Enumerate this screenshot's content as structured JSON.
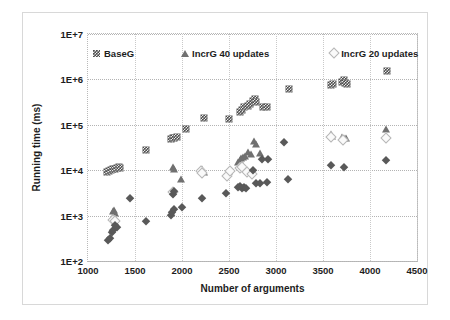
{
  "chart_data": {
    "type": "scatter",
    "title": "",
    "xlabel": "Number of arguments",
    "ylabel": "Running time (ms)",
    "xlim": [
      1000,
      4500
    ],
    "ylim": [
      100,
      10000000
    ],
    "yscale": "log",
    "xticks": [
      "1000",
      "1500",
      "2000",
      "2500",
      "3000",
      "3500",
      "4000",
      "4500"
    ],
    "xtick_values": [
      1000,
      1500,
      2000,
      2500,
      3000,
      3500,
      4000,
      4500
    ],
    "yticks": [
      "1E+2",
      "1E+3",
      "1E+4",
      "1E+5",
      "1E+6",
      "1E+7"
    ],
    "ytick_values": [
      100,
      1000,
      10000,
      100000,
      1000000,
      10000000
    ],
    "grid": true,
    "legend_position": "top-inside",
    "series": [
      {
        "name": "BaseG",
        "marker": "crosshatch-square",
        "color": "#4d4d4d",
        "points": [
          [
            1205,
            9200
          ],
          [
            1225,
            9600
          ],
          [
            1245,
            10000
          ],
          [
            1265,
            10400
          ],
          [
            1285,
            10800
          ],
          [
            1305,
            11200
          ],
          [
            1325,
            11600
          ],
          [
            1345,
            11200
          ],
          [
            1620,
            28000
          ],
          [
            1880,
            48000
          ],
          [
            1900,
            52000
          ],
          [
            1920,
            50000
          ],
          [
            1945,
            55000
          ],
          [
            2040,
            82000
          ],
          [
            2230,
            140000
          ],
          [
            2500,
            135000
          ],
          [
            2620,
            190000
          ],
          [
            2640,
            210000
          ],
          [
            2660,
            250000
          ],
          [
            2700,
            265000
          ],
          [
            2720,
            290000
          ],
          [
            2760,
            330000
          ],
          [
            2775,
            370000
          ],
          [
            2790,
            310000
          ],
          [
            2860,
            250000
          ],
          [
            2900,
            245000
          ],
          [
            3140,
            620000
          ],
          [
            3580,
            760000
          ],
          [
            3610,
            790000
          ],
          [
            3700,
            880000
          ],
          [
            3720,
            950000
          ],
          [
            3735,
            830000
          ],
          [
            3750,
            780000
          ],
          [
            4180,
            1500000
          ]
        ]
      },
      {
        "name": "IncrG 40 updates",
        "marker": "triangle",
        "color": "#707070",
        "points": [
          [
            1265,
            1250
          ],
          [
            1280,
            1350
          ],
          [
            1290,
            1150
          ],
          [
            1900,
            11500
          ],
          [
            1915,
            10500
          ],
          [
            1990,
            6500
          ],
          [
            2210,
            10500
          ],
          [
            2230,
            9000
          ],
          [
            2500,
            9500
          ],
          [
            2600,
            15000
          ],
          [
            2615,
            17000
          ],
          [
            2630,
            18500
          ],
          [
            2650,
            20000
          ],
          [
            2665,
            21000
          ],
          [
            2700,
            25000
          ],
          [
            2730,
            23000
          ],
          [
            2770,
            45000
          ],
          [
            2785,
            38000
          ],
          [
            2830,
            24000
          ],
          [
            3580,
            62000
          ],
          [
            3600,
            58000
          ],
          [
            3700,
            55000
          ],
          [
            3720,
            50000
          ],
          [
            3740,
            52000
          ],
          [
            4170,
            82000
          ]
        ]
      },
      {
        "name": "IncrG 20 updates",
        "marker": "open-diamond",
        "color": "#b6b6b6",
        "points": [
          [
            1270,
            820
          ],
          [
            1290,
            760
          ],
          [
            1900,
            3300
          ],
          [
            2200,
            9500
          ],
          [
            2215,
            8500
          ],
          [
            2480,
            7500
          ],
          [
            2510,
            9800
          ],
          [
            2620,
            11000
          ],
          [
            2640,
            12000
          ],
          [
            2690,
            9000
          ],
          [
            2740,
            8200
          ],
          [
            3590,
            55000
          ],
          [
            3710,
            47000
          ],
          [
            4170,
            50000
          ]
        ]
      },
      {
        "name": "IncrG",
        "marker": "diamond",
        "color": "#595959",
        "points": [
          [
            1215,
            290
          ],
          [
            1230,
            320
          ],
          [
            1250,
            430
          ],
          [
            1265,
            480
          ],
          [
            1290,
            620
          ],
          [
            1305,
            560
          ],
          [
            1450,
            2400
          ],
          [
            1620,
            760
          ],
          [
            1880,
            1050
          ],
          [
            1895,
            1200
          ],
          [
            1910,
            1400
          ],
          [
            1900,
            3000
          ],
          [
            1915,
            3500
          ],
          [
            2000,
            1550
          ],
          [
            2210,
            2500
          ],
          [
            2470,
            3100
          ],
          [
            2600,
            4200
          ],
          [
            2620,
            4400
          ],
          [
            2640,
            4100
          ],
          [
            2660,
            4300
          ],
          [
            2680,
            4000
          ],
          [
            2760,
            10000
          ],
          [
            2790,
            5300
          ],
          [
            2830,
            5200
          ],
          [
            2900,
            5400
          ],
          [
            2920,
            18000
          ],
          [
            2850,
            17500
          ],
          [
            3090,
            42000
          ],
          [
            3130,
            6400
          ],
          [
            3580,
            13000
          ],
          [
            3720,
            12000
          ],
          [
            4170,
            17000
          ]
        ]
      }
    ]
  }
}
